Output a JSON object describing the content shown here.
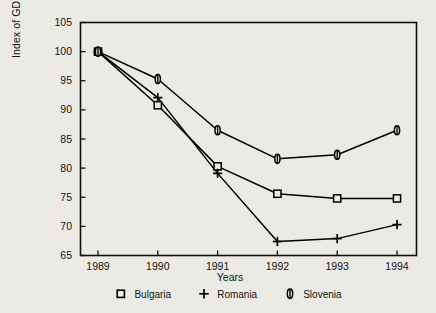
{
  "chart_data": {
    "type": "line",
    "title": "",
    "xlabel": "Years",
    "ylabel": "Index of GDP change (1989=100)",
    "x": [
      1989,
      1990,
      1991,
      1992,
      1993,
      1994
    ],
    "xtick_labels": [
      "1989",
      "1990",
      "1991",
      "1992",
      "1993",
      "1994"
    ],
    "ytick_labels": [
      "65",
      "70",
      "75",
      "80",
      "85",
      "90",
      "95",
      "100",
      "105"
    ],
    "yticks": [
      65,
      70,
      75,
      80,
      85,
      90,
      95,
      100,
      105
    ],
    "xlim": [
      1988.7,
      1994.3
    ],
    "ylim": [
      65,
      105
    ],
    "grid": false,
    "legend_position": "below",
    "series": [
      {
        "name": "Bulgaria",
        "marker": "square",
        "color": "#000000",
        "values": [
          100.0,
          90.8,
          80.3,
          75.6,
          74.8,
          74.8
        ]
      },
      {
        "name": "Romania",
        "marker": "plus",
        "color": "#000000",
        "values": [
          100.0,
          92.1,
          79.1,
          67.4,
          67.9,
          70.3
        ]
      },
      {
        "name": "Slovenia",
        "marker": "oval",
        "color": "#000000",
        "values": [
          100.0,
          95.3,
          86.5,
          81.6,
          82.3,
          86.5
        ]
      }
    ]
  },
  "legend": {
    "items": [
      {
        "label": "Bulgaria",
        "marker": "square"
      },
      {
        "label": "Romania",
        "marker": "plus"
      },
      {
        "label": "Slovenia",
        "marker": "oval"
      }
    ]
  },
  "figure": {
    "background": "#eceae4",
    "axis_color": "#111111"
  }
}
